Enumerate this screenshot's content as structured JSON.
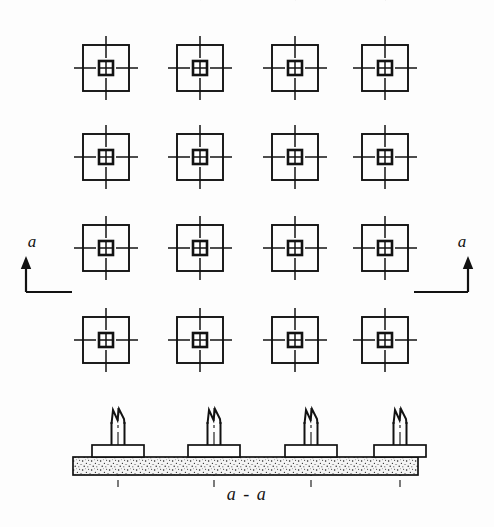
{
  "drawing": {
    "type": "engineering-drawing",
    "subject": "Reinforced concrete isolated column footings - foundation plan and section",
    "background_color": "#fdfdfd",
    "line_color": "#121212",
    "blinding_fill": "#f2f2f2"
  },
  "plan": {
    "name": "foundation-plan",
    "slab": {
      "outer": {
        "x": 78,
        "y": 32,
        "width": 330,
        "height": 340
      },
      "inner_offset": 4
    },
    "grid": {
      "columns_x": [
        106,
        200,
        295,
        385
      ],
      "rows_y": [
        68,
        157,
        248,
        340
      ],
      "count_x": 4,
      "count_y": 4,
      "centerline_style": "dash-dot",
      "centerline_extension": 28
    },
    "footing": {
      "pad_size": 46,
      "column_size": 14,
      "column_divisions": 4
    }
  },
  "section_markers": [
    {
      "name": "section-marker-left",
      "label": "a",
      "label_x": 32,
      "label_y": 247,
      "leader_x1": 72,
      "leader_y": 292,
      "leader_x2": 26,
      "arrow_x": 26,
      "arrow_tip_y": 256,
      "direction": "up"
    },
    {
      "name": "section-marker-right",
      "label": "a",
      "label_x": 462,
      "label_y": 247,
      "leader_x1": 414,
      "leader_y": 292,
      "leader_x2": 468,
      "arrow_x": 468,
      "arrow_tip_y": 256,
      "direction": "up"
    }
  ],
  "section": {
    "name": "section-a-a",
    "label": "a - a",
    "label_x": 247,
    "label_y": 500,
    "blinding": {
      "x": 73,
      "y": 457,
      "width": 345,
      "height": 18
    },
    "pad_width": 52,
    "pad_height": 12,
    "pad_top_y": 445,
    "column_width": 13,
    "column_top_y": 416,
    "columns_x": [
      118,
      214,
      311,
      400
    ],
    "centerline_top_y": 408,
    "centerline_bottom_y": 487,
    "break_symbol": "zigzag"
  }
}
